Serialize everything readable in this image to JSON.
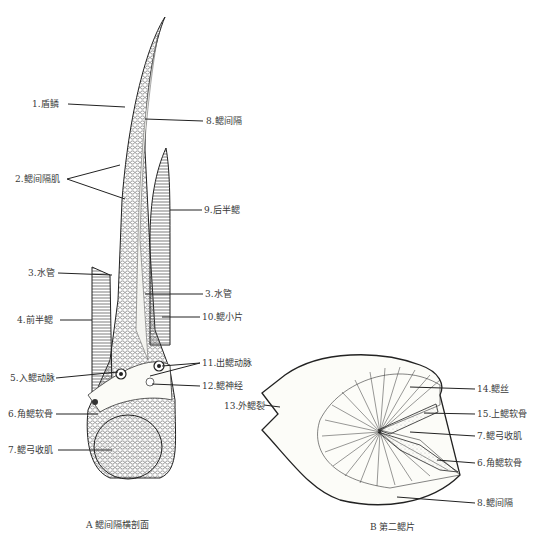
{
  "figure": {
    "panel_a": {
      "caption": "A 鳃间隔横剖面",
      "labels": [
        {
          "id": "1",
          "text": "1.盾鳞",
          "x": 32,
          "y": 100
        },
        {
          "id": "8a",
          "text": "8.鳃间隔",
          "x": 206,
          "y": 117
        },
        {
          "id": "2",
          "text": "2.鳃间隔肌",
          "x": 15,
          "y": 175
        },
        {
          "id": "9",
          "text": "9.后半鳃",
          "x": 204,
          "y": 206
        },
        {
          "id": "3a",
          "text": "3.水管",
          "x": 28,
          "y": 269
        },
        {
          "id": "3b",
          "text": "3.水管",
          "x": 205,
          "y": 291
        },
        {
          "id": "4",
          "text": "4.前半鳃",
          "x": 17,
          "y": 316
        },
        {
          "id": "10",
          "text": "10.鳃小片",
          "x": 202,
          "y": 313
        },
        {
          "id": "11",
          "text": "11.出鳃动脉",
          "x": 202,
          "y": 360
        },
        {
          "id": "5",
          "text": "5.入鳃动脉",
          "x": 10,
          "y": 374
        },
        {
          "id": "12",
          "text": "12.鳃神经",
          "x": 202,
          "y": 383
        },
        {
          "id": "6",
          "text": "6.角鳃软骨",
          "x": 8,
          "y": 410
        },
        {
          "id": "7",
          "text": "7.鳃弓收肌",
          "x": 8,
          "y": 446
        }
      ]
    },
    "panel_b": {
      "caption": "B 第二鳃片",
      "labels": [
        {
          "id": "13",
          "text": "13.外鳃裂",
          "x": 224,
          "y": 402
        },
        {
          "id": "14",
          "text": "14.鳃丝",
          "x": 477,
          "y": 386
        },
        {
          "id": "15",
          "text": "15.上鳃软骨",
          "x": 477,
          "y": 410
        },
        {
          "id": "7b",
          "text": "7.鳃弓收肌",
          "x": 477,
          "y": 433
        },
        {
          "id": "6b",
          "text": "6.角鳃软骨",
          "x": 477,
          "y": 460
        },
        {
          "id": "8b",
          "text": "8.鳃间隔",
          "x": 477,
          "y": 500
        }
      ]
    }
  }
}
